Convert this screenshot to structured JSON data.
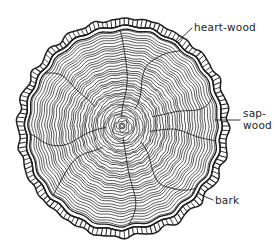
{
  "figure": {
    "background_color": "#ffffff",
    "ink_color": "#1d1d1d",
    "width": 276,
    "height": 249
  },
  "labels": [
    {
      "id": "heart-wood",
      "text": "heart-wood",
      "lines": [
        "heart-wood"
      ],
      "text_x": 194,
      "text_y": 31,
      "leader": {
        "x1": 192,
        "y1": 28,
        "x2": 176,
        "y2": 43
      }
    },
    {
      "id": "sap-wood",
      "text": "sap-wood",
      "lines": [
        "sap-",
        "wood"
      ],
      "text_x": 243,
      "text_y": 117,
      "leader": {
        "x1": 240,
        "y1": 120,
        "x2": 215,
        "y2": 120
      }
    },
    {
      "id": "bark",
      "text": "bark",
      "lines": [
        "bark"
      ],
      "text_x": 215,
      "text_y": 204,
      "leader": {
        "x1": 213,
        "y1": 200,
        "x2": 199,
        "y2": 194
      }
    }
  ],
  "anatomy": {
    "center_x": 122,
    "center_y": 126,
    "pith_radius": 3,
    "growth_rings_count": 40,
    "outer_wood_radius_x": 104,
    "outer_wood_radius_y": 110,
    "bark_band_thickness": 7,
    "bark_hatch_count": 150,
    "radial_ray_count": 9
  },
  "chart_data": {
    "type": "diagram",
    "parts": [
      {
        "name": "heart-wood",
        "description": "dark dense inner wood at the centre of the trunk"
      },
      {
        "name": "sap-wood",
        "description": "outer living wood ring just inside the bark"
      },
      {
        "name": "bark",
        "description": "hatched outer protective layer of the trunk"
      }
    ],
    "annotations": [
      "heart-wood",
      "sap-wood",
      "bark"
    ]
  }
}
